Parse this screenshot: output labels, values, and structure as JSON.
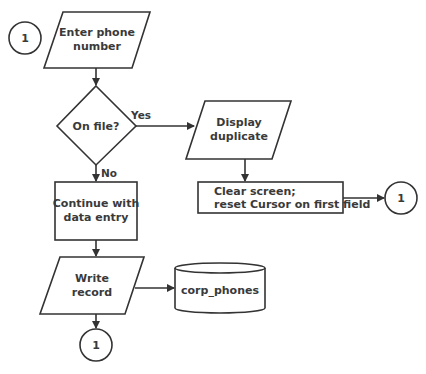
{
  "diagram": {
    "type": "flowchart",
    "connectors": {
      "start": {
        "label": "1"
      },
      "after_clear": {
        "label": "1"
      },
      "end": {
        "label": "1"
      }
    },
    "nodes": {
      "enter_phone": {
        "shape": "parallelogram",
        "line1": "Enter phone",
        "line2": "number"
      },
      "on_file": {
        "shape": "diamond",
        "label": "On file?"
      },
      "display_duplicate": {
        "shape": "parallelogram",
        "line1": "Display",
        "line2": "duplicate"
      },
      "clear_screen": {
        "shape": "rectangle",
        "line1": "Clear screen;",
        "line2": "reset Cursor on first field"
      },
      "continue_entry": {
        "shape": "rectangle",
        "line1": "Continue with",
        "line2": "data entry"
      },
      "write_record": {
        "shape": "parallelogram",
        "line1": "Write",
        "line2": "record"
      },
      "corp_phones": {
        "shape": "cylinder",
        "label": "corp_phones"
      }
    },
    "edge_labels": {
      "yes": "Yes",
      "no": "No"
    },
    "colors": {
      "stroke": "#333333",
      "fill": "#ffffff",
      "text": "#3a3a3a"
    }
  }
}
